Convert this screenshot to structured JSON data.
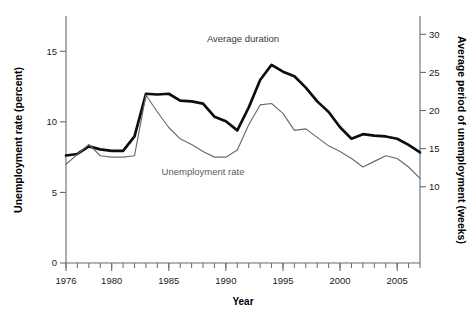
{
  "chart_data": {
    "type": "line",
    "title": "",
    "xlabel": "Year",
    "ylabel_left": "Unemployment rate (percent)",
    "ylabel_right": "Average period of unemployment (weeks)",
    "xlim": [
      1976,
      2007
    ],
    "ylim_left": [
      0,
      17.5
    ],
    "ylim_right": [
      0,
      32.4
    ],
    "yticks_left": [
      0,
      5,
      10,
      15
    ],
    "yticks_right": [
      10,
      15,
      20,
      25,
      30
    ],
    "xticks_labeled": [
      1976,
      1980,
      1985,
      1990,
      1995,
      2000,
      2005
    ],
    "xticks_minor_every": 1,
    "grid": false,
    "legend_position": "inline-annotations",
    "x": [
      1976,
      1977,
      1978,
      1979,
      1980,
      1981,
      1982,
      1983,
      1984,
      1985,
      1986,
      1987,
      1988,
      1989,
      1990,
      1991,
      1992,
      1993,
      1994,
      1995,
      1996,
      1997,
      1998,
      1999,
      2000,
      2001,
      2002,
      2003,
      2004,
      2005,
      2006,
      2007
    ],
    "series": [
      {
        "name": "Average duration",
        "axis": "right",
        "unit": "weeks",
        "color": "#0d0d0d",
        "style": "thick",
        "values": [
          14.1,
          14.3,
          15.3,
          14.9,
          14.7,
          14.7,
          16.6,
          22.2,
          22.1,
          22.2,
          21.3,
          21.2,
          20.9,
          19.2,
          18.6,
          17.4,
          20.4,
          24.0,
          26.0,
          25.1,
          24.5,
          23.0,
          21.2,
          19.8,
          17.8,
          16.3,
          16.9,
          16.7,
          16.6,
          16.3,
          15.5,
          14.5
        ]
      },
      {
        "name": "Unemployment rate",
        "axis": "left",
        "unit": "percent",
        "color": "#6a6a6a",
        "style": "thin",
        "values": [
          7.0,
          7.7,
          8.4,
          7.6,
          7.5,
          7.5,
          7.6,
          11.9,
          10.7,
          9.6,
          8.8,
          8.4,
          7.9,
          7.5,
          7.5,
          8.0,
          9.8,
          11.2,
          11.3,
          10.6,
          9.4,
          9.5,
          8.9,
          8.3,
          7.9,
          7.4,
          6.8,
          7.2,
          7.6,
          7.4,
          6.8,
          6.0
        ]
      }
    ],
    "annotations": [
      {
        "text": "Average duration",
        "x": 1991.5,
        "y_right": 29.0
      },
      {
        "text": "Unemployment rate",
        "x": 1988.0,
        "y_left": 6.2
      }
    ]
  }
}
